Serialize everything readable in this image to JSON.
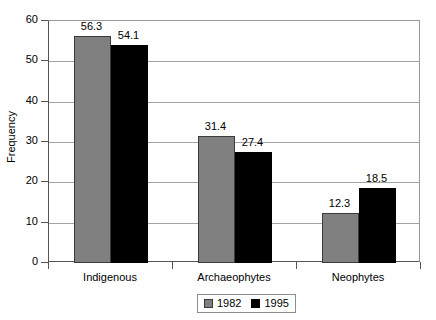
{
  "chart_data": {
    "type": "bar",
    "title": "",
    "subtitle": "",
    "xlabel": "",
    "ylabel": "Frequency",
    "categories": [
      "Indigenous",
      "Archaeophytes",
      "Neophytes"
    ],
    "series": [
      {
        "name": "1982",
        "color": "#808080",
        "values": [
          56.3,
          31.4,
          12.3
        ]
      },
      {
        "name": "1995",
        "color": "#000000",
        "values": [
          54.1,
          27.4,
          18.5
        ]
      }
    ],
    "value_labels": [
      [
        "56.3",
        "54.1"
      ],
      [
        "31.4",
        "27.4"
      ],
      [
        "12.3",
        "18.5"
      ]
    ],
    "ylim": [
      0,
      60
    ],
    "ytick_values": [
      0,
      10,
      20,
      30,
      40,
      50,
      60
    ],
    "ytick_labels": [
      "0",
      "10",
      "20",
      "30",
      "40",
      "50",
      "60"
    ],
    "grid": true,
    "grid_axis": "y",
    "legend_position": "bottom-center",
    "plot_background": "#ffffff",
    "frame_color": "#9a9a9a",
    "axis_color": "#555555"
  },
  "axis": {
    "y_title": "Frequency"
  },
  "legend": {
    "entries": [
      {
        "label": "1982",
        "color": "#808080"
      },
      {
        "label": "1995",
        "color": "#000000"
      }
    ]
  }
}
